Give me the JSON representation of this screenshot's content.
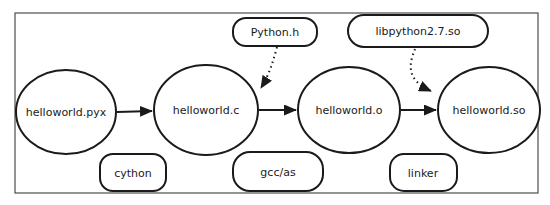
{
  "diagram": {
    "nodes": [
      {
        "label": "helloworld.pyx"
      },
      {
        "label": "helloworld.c"
      },
      {
        "label": "helloworld.o"
      },
      {
        "label": "helloworld.so"
      }
    ],
    "inputs": [
      {
        "label": "Python.h"
      },
      {
        "label": "libpython2.7.so"
      }
    ],
    "tools": [
      {
        "label": "cython"
      },
      {
        "label": "gcc/as"
      },
      {
        "label": "linker"
      }
    ],
    "colors": {
      "stroke": "#1a1a1a",
      "frame": "#4d4d4d",
      "background": "#ffffff",
      "text": "#1a1a1a"
    }
  }
}
